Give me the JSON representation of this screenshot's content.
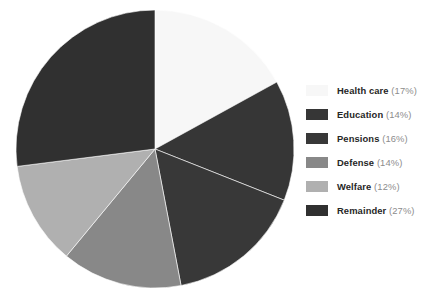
{
  "chart_data": {
    "type": "pie",
    "title": "",
    "categories": [
      "Health care",
      "Education",
      "Pensions",
      "Defense",
      "Welfare",
      "Remainder"
    ],
    "values": [
      17,
      14,
      16,
      14,
      12,
      27
    ],
    "value_unit": "%",
    "legend_position": "right",
    "start_angle_deg": 90,
    "direction": "clockwise",
    "colors": [
      "#f7f7f7",
      "#363636",
      "#383838",
      "#888888",
      "#b0b0b0",
      "#303030"
    ],
    "slices": [
      {
        "label": "Health care",
        "value": 17,
        "percent_text": "(17%)",
        "color": "#f7f7f7"
      },
      {
        "label": "Education",
        "value": 14,
        "percent_text": "(14%)",
        "color": "#363636"
      },
      {
        "label": "Pensions",
        "value": 16,
        "percent_text": "(16%)",
        "color": "#383838"
      },
      {
        "label": "Defense",
        "value": 14,
        "percent_text": "(14%)",
        "color": "#888888"
      },
      {
        "label": "Welfare",
        "value": 12,
        "percent_text": "(12%)",
        "color": "#b0b0b0"
      },
      {
        "label": "Remainder",
        "value": 27,
        "percent_text": "(27%)",
        "color": "#303030"
      }
    ]
  },
  "legend": {
    "items": [
      {
        "label": "Health care",
        "percent_text": "(17%)",
        "color": "#f7f7f7"
      },
      {
        "label": "Education",
        "percent_text": "(14%)",
        "color": "#363636"
      },
      {
        "label": "Pensions",
        "percent_text": "(16%)",
        "color": "#383838"
      },
      {
        "label": "Defense",
        "percent_text": "(14%)",
        "color": "#888888"
      },
      {
        "label": "Welfare",
        "percent_text": "(12%)",
        "color": "#b0b0b0"
      },
      {
        "label": "Remainder",
        "percent_text": "(27%)",
        "color": "#303030"
      }
    ]
  },
  "geometry": {
    "center_x": 155,
    "center_y": 149,
    "radius": 139
  }
}
